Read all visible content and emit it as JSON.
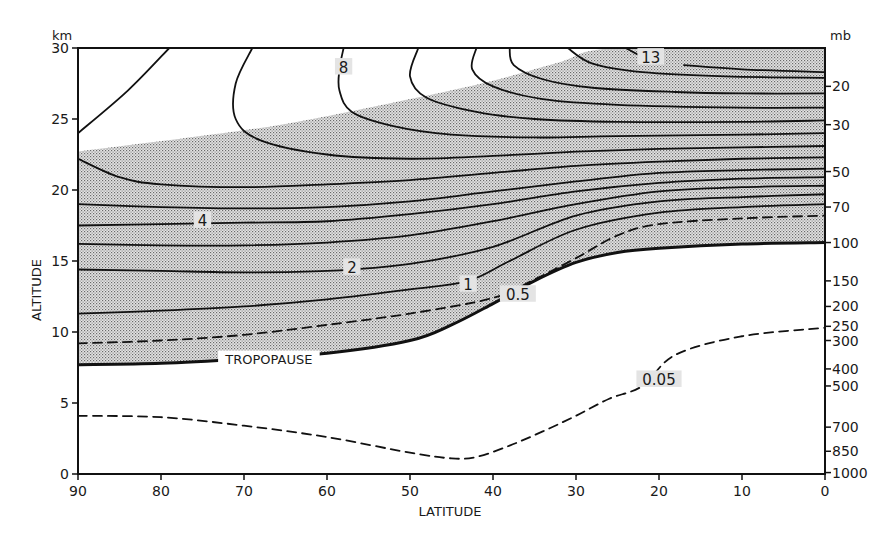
{
  "chart_data": {
    "type": "contour",
    "title": "",
    "xlabel": "LATITUDE",
    "ylabel": "ALTITUDE",
    "y_unit_left": "km",
    "y_unit_right": "mb",
    "xlim": [
      90,
      0
    ],
    "ylim": [
      0,
      30
    ],
    "x_ticks": [
      90,
      80,
      70,
      60,
      50,
      40,
      30,
      20,
      10,
      0
    ],
    "y_ticks_left": [
      0,
      5,
      10,
      15,
      20,
      25,
      30
    ],
    "y_ticks_right": [
      {
        "label": "20",
        "km": 27.3
      },
      {
        "label": "30",
        "km": 24.6
      },
      {
        "label": "50",
        "km": 21.3
      },
      {
        "label": "70",
        "km": 18.8
      },
      {
        "label": "100",
        "km": 16.3
      },
      {
        "label": "150",
        "km": 13.6
      },
      {
        "label": "200",
        "km": 11.8
      },
      {
        "label": "250",
        "km": 10.4
      },
      {
        "label": "300",
        "km": 9.4
      },
      {
        "label": "400",
        "km": 7.4
      },
      {
        "label": "500",
        "km": 6.2
      },
      {
        "label": "700",
        "km": 3.3
      },
      {
        "label": "850",
        "km": 1.6
      },
      {
        "label": "1000",
        "km": 0.1
      }
    ],
    "grid": false,
    "shaded_region": "stratosphere between tropopause and upper boundary (stippled)",
    "contour_labels": [
      {
        "text": "13",
        "lat": 21,
        "km": 29.2
      },
      {
        "text": "8",
        "lat": 58,
        "km": 28.5
      },
      {
        "text": "4",
        "lat": 75,
        "km": 17.7
      },
      {
        "text": "2",
        "lat": 57,
        "km": 14.4
      },
      {
        "text": "1",
        "lat": 43,
        "km": 13.2
      },
      {
        "text": "0.5",
        "lat": 37,
        "km": 12.5
      },
      {
        "text": "0.05",
        "lat": 20,
        "km": 6.5
      },
      {
        "text": "TROPOPAUSE",
        "lat": 67,
        "km": 8.0
      }
    ],
    "series": [
      {
        "name": "tropopause",
        "style": "bold",
        "points": [
          [
            90,
            7.7
          ],
          [
            80,
            7.8
          ],
          [
            70,
            8.1
          ],
          [
            60,
            8.5
          ],
          [
            50,
            9.4
          ],
          [
            45,
            10.5
          ],
          [
            40,
            12.0
          ],
          [
            35,
            13.6
          ],
          [
            30,
            14.9
          ],
          [
            25,
            15.6
          ],
          [
            20,
            15.9
          ],
          [
            10,
            16.2
          ],
          [
            0,
            16.3
          ]
        ]
      },
      {
        "name": "0.05",
        "style": "dashed",
        "points": [
          [
            90,
            4.1
          ],
          [
            80,
            4.0
          ],
          [
            70,
            3.4
          ],
          [
            60,
            2.6
          ],
          [
            50,
            1.5
          ],
          [
            45,
            1.1
          ],
          [
            42,
            1.2
          ],
          [
            38,
            2.0
          ],
          [
            34,
            3.0
          ],
          [
            30,
            4.1
          ],
          [
            26,
            5.3
          ],
          [
            22,
            6.2
          ],
          [
            18,
            8.4
          ],
          [
            10,
            9.7
          ],
          [
            0,
            10.3
          ]
        ]
      },
      {
        "name": "0.5",
        "style": "dashed",
        "points": [
          [
            90,
            9.2
          ],
          [
            80,
            9.4
          ],
          [
            70,
            9.8
          ],
          [
            60,
            10.5
          ],
          [
            50,
            11.3
          ],
          [
            40,
            12.4
          ],
          [
            35,
            13.7
          ],
          [
            30,
            15.2
          ],
          [
            25,
            16.8
          ],
          [
            20,
            17.6
          ],
          [
            10,
            18.0
          ],
          [
            0,
            18.2
          ]
        ]
      },
      {
        "name": "1",
        "points": [
          [
            90,
            11.3
          ],
          [
            80,
            11.5
          ],
          [
            70,
            11.8
          ],
          [
            60,
            12.3
          ],
          [
            50,
            13.0
          ],
          [
            43,
            13.6
          ],
          [
            38,
            15.0
          ],
          [
            30,
            17.2
          ],
          [
            20,
            18.4
          ],
          [
            10,
            18.8
          ],
          [
            0,
            19.0
          ]
        ]
      },
      {
        "name": "2",
        "points": [
          [
            90,
            14.4
          ],
          [
            80,
            14.3
          ],
          [
            70,
            14.2
          ],
          [
            60,
            14.3
          ],
          [
            50,
            14.8
          ],
          [
            40,
            16.0
          ],
          [
            30,
            18.2
          ],
          [
            20,
            19.2
          ],
          [
            10,
            19.5
          ],
          [
            0,
            19.7
          ]
        ]
      },
      {
        "name": "3",
        "points": [
          [
            90,
            16.2
          ],
          [
            80,
            16.1
          ],
          [
            70,
            16.1
          ],
          [
            60,
            16.3
          ],
          [
            50,
            16.8
          ],
          [
            40,
            17.8
          ],
          [
            30,
            19.0
          ],
          [
            20,
            19.9
          ],
          [
            10,
            20.2
          ],
          [
            0,
            20.3
          ]
        ]
      },
      {
        "name": "4",
        "points": [
          [
            90,
            17.5
          ],
          [
            80,
            17.6
          ],
          [
            70,
            17.7
          ],
          [
            60,
            17.8
          ],
          [
            50,
            18.3
          ],
          [
            40,
            19.0
          ],
          [
            30,
            19.9
          ],
          [
            20,
            20.5
          ],
          [
            10,
            20.8
          ],
          [
            0,
            20.9
          ]
        ]
      },
      {
        "name": "5",
        "points": [
          [
            90,
            19.0
          ],
          [
            80,
            18.8
          ],
          [
            70,
            18.7
          ],
          [
            60,
            18.8
          ],
          [
            50,
            19.2
          ],
          [
            40,
            19.9
          ],
          [
            30,
            20.6
          ],
          [
            20,
            21.2
          ],
          [
            10,
            21.4
          ],
          [
            0,
            21.5
          ]
        ]
      },
      {
        "name": "6",
        "points": [
          [
            90,
            22.2
          ],
          [
            85,
            20.9
          ],
          [
            80,
            20.4
          ],
          [
            70,
            20.2
          ],
          [
            60,
            20.4
          ],
          [
            50,
            20.7
          ],
          [
            40,
            21.2
          ],
          [
            30,
            21.7
          ],
          [
            20,
            22.0
          ],
          [
            10,
            22.2
          ],
          [
            0,
            22.3
          ]
        ]
      },
      {
        "name": "7",
        "points": [
          [
            69,
            30.0
          ],
          [
            71,
            27.5
          ],
          [
            71,
            25.0
          ],
          [
            68,
            23.5
          ],
          [
            60,
            22.5
          ],
          [
            50,
            22.2
          ],
          [
            40,
            22.4
          ],
          [
            30,
            22.7
          ],
          [
            20,
            22.9
          ],
          [
            10,
            23.0
          ],
          [
            0,
            23.1
          ]
        ]
      },
      {
        "name": "8",
        "points": [
          [
            58,
            30.0
          ],
          [
            58.5,
            28.5
          ],
          [
            58.5,
            27.0
          ],
          [
            57,
            25.5
          ],
          [
            52,
            24.5
          ],
          [
            45,
            23.9
          ],
          [
            35,
            23.7
          ],
          [
            25,
            23.8
          ],
          [
            10,
            23.9
          ],
          [
            0,
            24.0
          ]
        ]
      },
      {
        "name": "9",
        "points": [
          [
            49,
            30.0
          ],
          [
            50,
            28.0
          ],
          [
            48,
            26.5
          ],
          [
            42,
            25.5
          ],
          [
            35,
            25.0
          ],
          [
            25,
            24.8
          ],
          [
            10,
            24.8
          ],
          [
            0,
            24.9
          ]
        ]
      },
      {
        "name": "10",
        "points": [
          [
            42,
            30.0
          ],
          [
            42.5,
            28.5
          ],
          [
            40,
            27.3
          ],
          [
            34,
            26.4
          ],
          [
            25,
            26.0
          ],
          [
            10,
            25.8
          ],
          [
            0,
            25.8
          ]
        ]
      },
      {
        "name": "11",
        "points": [
          [
            38,
            30.0
          ],
          [
            37.5,
            28.8
          ],
          [
            34,
            27.8
          ],
          [
            28,
            27.2
          ],
          [
            18,
            26.9
          ],
          [
            10,
            26.8
          ],
          [
            0,
            26.8
          ]
        ]
      },
      {
        "name": "12",
        "points": [
          [
            31,
            30.0
          ],
          [
            28,
            28.9
          ],
          [
            22,
            28.3
          ],
          [
            12,
            28.0
          ],
          [
            0,
            27.9
          ]
        ]
      },
      {
        "name": "13",
        "points": [
          [
            24,
            30.0
          ],
          [
            22,
            29.4
          ],
          [
            20,
            29.2
          ]
        ]
      },
      {
        "name": "13b",
        "points": [
          [
            17,
            28.8
          ],
          [
            10,
            28.5
          ],
          [
            0,
            28.3
          ]
        ]
      },
      {
        "name": "edge",
        "points": [
          [
            90,
            24.0
          ],
          [
            84,
            27.0
          ],
          [
            79,
            30.0
          ]
        ]
      }
    ]
  },
  "labels": {
    "km": "km",
    "mb": "mb",
    "xlabel": "LATITUDE",
    "ylabel": "ALTITUDE"
  }
}
